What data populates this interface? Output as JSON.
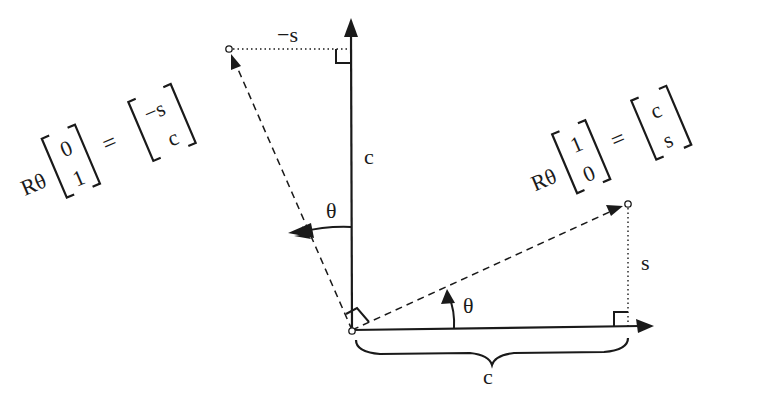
{
  "diagram": {
    "axes": {
      "horizontal_length_label": "c",
      "vertical_length_label": "c"
    },
    "rotated_e1": {
      "equation": {
        "operator": "Rθ",
        "input_vector": [
          "1",
          "0"
        ],
        "equals": "=",
        "output_vector": [
          "c",
          "s"
        ]
      },
      "angle_label": "θ",
      "vertical_component_label": "s"
    },
    "rotated_e2": {
      "equation": {
        "operator": "Rθ",
        "input_vector": [
          "0",
          "1"
        ],
        "equals": "=",
        "output_vector": [
          "−s",
          "c"
        ]
      },
      "angle_label": "θ",
      "horizontal_component_label": "−s"
    },
    "brace_label": "c",
    "colors": {
      "ink": "#1a1a1a",
      "background": "#ffffff"
    }
  }
}
